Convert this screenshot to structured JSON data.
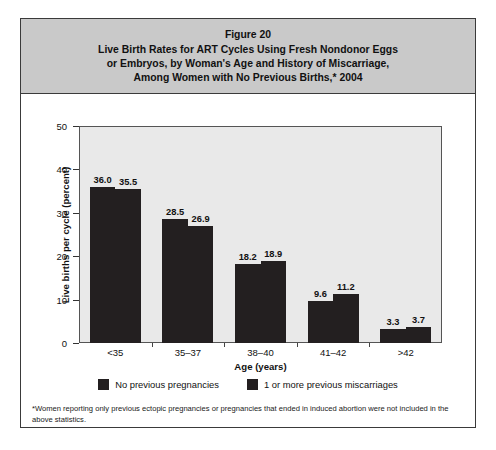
{
  "figure": {
    "title_lines": [
      "Figure 20",
      "Live Birth Rates for ART Cycles Using Fresh Nondonor Eggs",
      "or Embryos, by Woman's Age and History of Miscarriage,",
      "Among Women with No Previous Births,* 2004"
    ],
    "footnote": "*Women reporting only previous ectopic pregnancies or pregnancies that ended in induced abortion were not included in the above statistics.",
    "colors": {
      "bar": "#231f20",
      "title_band": "#c9c9c9",
      "plot_background": "#e9e9e9",
      "frame_border": "#3a3a3a"
    }
  },
  "chart_data": {
    "type": "bar",
    "title": "Live Birth Rates for ART Cycles Using Fresh Nondonor Eggs or Embryos, by Woman's Age and History of Miscarriage, Among Women with No Previous Births,* 2004",
    "xlabel": "Age (years)",
    "ylabel": "Live births per cycle (percent)",
    "categories": [
      "<35",
      "35–37",
      "38–40",
      "41–42",
      ">42"
    ],
    "series": [
      {
        "name": "No previous pregnancies",
        "values": [
          36.0,
          28.5,
          18.2,
          9.6,
          3.3
        ],
        "labels": [
          "36.0",
          "28.5",
          "18.2",
          "9.6",
          "3.3"
        ],
        "color": "#231f20"
      },
      {
        "name": "1 or more previous miscarriages",
        "values": [
          35.5,
          26.9,
          18.9,
          11.2,
          3.7
        ],
        "labels": [
          "35.5",
          "26.9",
          "18.9",
          "11.2",
          "3.7"
        ],
        "color": "#231f20"
      }
    ],
    "ylim": [
      0,
      50
    ],
    "yticks": [
      0,
      10,
      20,
      30,
      40,
      50
    ],
    "ytick_labels": [
      "0",
      "10",
      "20",
      "30",
      "40",
      "50"
    ],
    "grid": false,
    "legend_position": "bottom"
  }
}
